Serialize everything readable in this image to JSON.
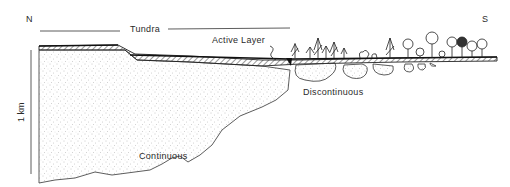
{
  "diagram": {
    "direction": {
      "north": "N",
      "south": "S"
    },
    "labels": {
      "tundra": "Tundra",
      "active_layer": "Active Layer",
      "discontinuous": "Discontinuous",
      "continuous": "Continuous",
      "scale": "1 km"
    },
    "colors": {
      "line": "#2a2a2a",
      "stipple": "#9a9a9a",
      "background": "#ffffff"
    }
  }
}
